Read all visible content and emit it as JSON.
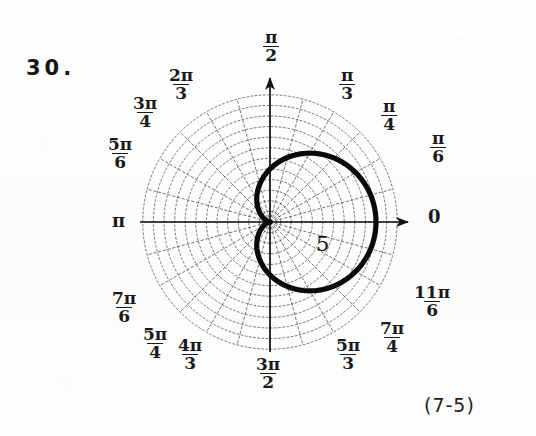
{
  "figure": {
    "problem_number": "30.",
    "figure_reference": "(7-5)",
    "radius_marker": "5",
    "polar_axis_label": "0"
  },
  "angle_labels": [
    {
      "name": "pi-over-6",
      "numerator": "π",
      "denominator": "6",
      "stacked": true,
      "text": "",
      "left": 430,
      "top": 130
    },
    {
      "name": "pi-over-4",
      "numerator": "π",
      "denominator": "4",
      "stacked": true,
      "text": "",
      "left": 381,
      "top": 98
    },
    {
      "name": "pi-over-3",
      "numerator": "π",
      "denominator": "3",
      "stacked": true,
      "text": "",
      "left": 339,
      "top": 67
    },
    {
      "name": "pi-over-2",
      "numerator": "π",
      "denominator": "2",
      "stacked": true,
      "text": "",
      "left": 263,
      "top": 29
    },
    {
      "name": "two-pi-over-3",
      "numerator": "2π",
      "denominator": "3",
      "stacked": true,
      "text": "",
      "left": 167,
      "top": 67
    },
    {
      "name": "three-pi-over-4",
      "numerator": "3π",
      "denominator": "4",
      "stacked": true,
      "text": "",
      "left": 131,
      "top": 95
    },
    {
      "name": "five-pi-over-6",
      "numerator": "5π",
      "denominator": "6",
      "stacked": true,
      "text": "",
      "left": 106,
      "top": 136
    },
    {
      "name": "pi",
      "numerator": "",
      "denominator": "",
      "stacked": false,
      "text": "π",
      "left": 112,
      "top": 212
    },
    {
      "name": "seven-pi-over-6",
      "numerator": "7π",
      "denominator": "6",
      "stacked": true,
      "text": "",
      "left": 110,
      "top": 290
    },
    {
      "name": "five-pi-over-4",
      "numerator": "5π",
      "denominator": "4",
      "stacked": true,
      "text": "",
      "left": 141,
      "top": 326
    },
    {
      "name": "four-pi-over-3",
      "numerator": "4π",
      "denominator": "3",
      "stacked": true,
      "text": "",
      "left": 176,
      "top": 337
    },
    {
      "name": "three-pi-over-2",
      "numerator": "3π",
      "denominator": "2",
      "stacked": true,
      "text": "",
      "left": 254,
      "top": 356
    },
    {
      "name": "five-pi-over-3",
      "numerator": "5π",
      "denominator": "3",
      "stacked": true,
      "text": "",
      "left": 334,
      "top": 337
    },
    {
      "name": "seven-pi-over-4",
      "numerator": "7π",
      "denominator": "4",
      "stacked": true,
      "text": "",
      "left": 378,
      "top": 320
    },
    {
      "name": "eleven-pi-over-6",
      "numerator": "11π",
      "denominator": "6",
      "stacked": true,
      "text": "",
      "left": 412,
      "top": 284
    }
  ],
  "chart_data": {
    "type": "line",
    "plot_kind": "polar",
    "title": "",
    "subtitle": "",
    "xlabel": "",
    "ylabel": "",
    "grid": true,
    "legend": false,
    "curve_name": "cardioid",
    "equation": "r = 5(1 + cos θ)",
    "theta_units": "radians",
    "theta_range": [
      0,
      6.283185307179586
    ],
    "r_range": [
      0,
      10
    ],
    "radial_gridlines": [
      1,
      2,
      3,
      4,
      5,
      6,
      7,
      8,
      9,
      10,
      11,
      12
    ],
    "angular_gridline_step_deg": 15,
    "labeled_angles_deg": [
      0,
      30,
      45,
      60,
      90,
      120,
      135,
      150,
      180,
      210,
      225,
      240,
      270,
      300,
      315,
      330
    ],
    "theta": [
      0,
      15,
      30,
      45,
      60,
      75,
      90,
      105,
      120,
      135,
      150,
      165,
      180,
      195,
      210,
      225,
      240,
      255,
      270,
      285,
      300,
      315,
      330,
      345,
      360
    ],
    "r": [
      10.0,
      9.83,
      9.33,
      8.54,
      7.5,
      6.29,
      5.0,
      3.71,
      2.5,
      1.46,
      0.67,
      0.17,
      0.0,
      0.17,
      0.67,
      1.46,
      2.5,
      3.71,
      5.0,
      6.29,
      7.5,
      8.54,
      9.33,
      9.83,
      10.0
    ],
    "annotations": [
      {
        "text": "5",
        "r": 5,
        "theta_deg": -18,
        "note": "radial scale marker"
      }
    ]
  },
  "geometry": {
    "center_x": 270,
    "center_y": 222,
    "unit_px": 10.6,
    "grid_max_units": 12,
    "spoke_count": 24
  }
}
